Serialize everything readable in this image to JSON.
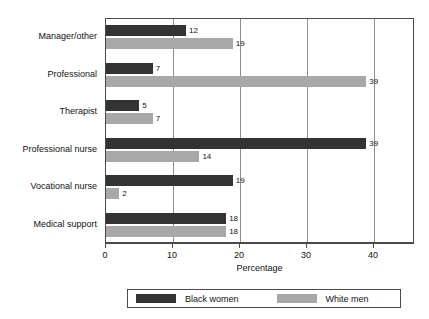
{
  "chart_data": {
    "type": "bar",
    "orientation": "horizontal",
    "title": "",
    "xlabel": "Percentage",
    "ylabel": "",
    "xlim": [
      0,
      46
    ],
    "xticks": [
      0,
      10,
      20,
      30,
      40
    ],
    "xtick_labels": [
      "0",
      "10",
      "20",
      "30",
      "40"
    ],
    "grid": true,
    "grid_axis": "x",
    "legend_position": "bottom",
    "categories": [
      "Manager/other",
      "Professional",
      "Therapist",
      "Professional nurse",
      "Vocational nurse",
      "Medical support"
    ],
    "series": [
      {
        "name": "Black women",
        "color": "#333333",
        "values": [
          12,
          7,
          5,
          39,
          19,
          18
        ]
      },
      {
        "name": "White men",
        "color": "#a8a8a8",
        "values": [
          19,
          39,
          7,
          14,
          2,
          18
        ]
      }
    ],
    "value_labels": [
      [
        "12",
        "19"
      ],
      [
        "7",
        "39"
      ],
      [
        "5",
        "7"
      ],
      [
        "39",
        "14"
      ],
      [
        "19",
        "2"
      ],
      [
        "18",
        "18"
      ]
    ]
  },
  "legend": {
    "entries": [
      {
        "label": "Black women",
        "color": "#333333"
      },
      {
        "label": "White men",
        "color": "#a8a8a8"
      }
    ]
  },
  "axis": {
    "x_title": "Percentage",
    "tick_labels": [
      "0",
      "10",
      "20",
      "30",
      "40"
    ]
  }
}
